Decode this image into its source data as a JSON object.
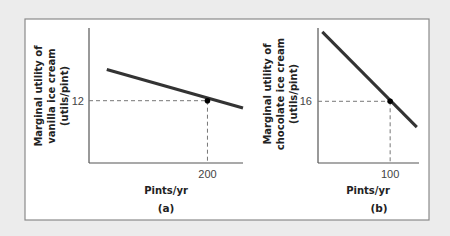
{
  "chart_data": [
    {
      "type": "line",
      "panel_label": "(a)",
      "title": "",
      "xlabel": "Pints/yr",
      "ylabel_lines": [
        "Marginal utility of",
        "vanilla ice cream",
        "(utils/pint)"
      ],
      "xticks": [
        {
          "value": 200,
          "label": "200"
        }
      ],
      "yticks": [
        {
          "value": 12,
          "label": "12"
        }
      ],
      "xlim": [
        0,
        260
      ],
      "ylim": [
        0,
        26
      ],
      "series": [
        {
          "name": "MU vanilla",
          "x": [
            30,
            260
          ],
          "y": [
            18,
            10.6
          ],
          "color": "#333333"
        }
      ],
      "highlight_point": {
        "x": 200,
        "y": 12
      },
      "grid": false,
      "guides": "dashed"
    },
    {
      "type": "line",
      "panel_label": "(b)",
      "title": "",
      "xlabel": "Pints/yr",
      "ylabel_lines": [
        "Marginal utility of",
        "chocolate ice cream",
        "(utils/pint)"
      ],
      "xticks": [
        {
          "value": 100,
          "label": "100"
        }
      ],
      "yticks": [
        {
          "value": 16,
          "label": "16"
        }
      ],
      "xlim": [
        0,
        140
      ],
      "ylim": [
        0,
        35
      ],
      "series": [
        {
          "name": "MU chocolate",
          "x": [
            6,
            137
          ],
          "y": [
            34,
            9.3
          ],
          "color": "#333333"
        }
      ],
      "highlight_point": {
        "x": 100,
        "y": 16
      },
      "grid": false,
      "guides": "dashed"
    }
  ]
}
